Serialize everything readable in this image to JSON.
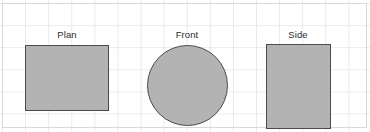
{
  "canvas": {
    "width": 370,
    "height": 132,
    "background_color": "#ffffff",
    "grid": {
      "visible": true,
      "line_color": "#e9e9e9",
      "column_spacing": 23,
      "row_spacing": 22,
      "border_color": "#d8d8d8"
    }
  },
  "drawing": {
    "type": "orthographic-projection",
    "shape_fill_color": "#b3b3b3",
    "shape_stroke_color": "#4a4a4a",
    "label_color": "#2b2b2b",
    "views": [
      {
        "id": "plan",
        "label": "Plan",
        "shape": "rectangle",
        "width_px": 84,
        "height_px": 66
      },
      {
        "id": "front",
        "label": "Front",
        "shape": "circle",
        "diameter_px": 81
      },
      {
        "id": "side",
        "label": "Side",
        "shape": "rectangle",
        "width_px": 65,
        "height_px": 85
      }
    ]
  }
}
